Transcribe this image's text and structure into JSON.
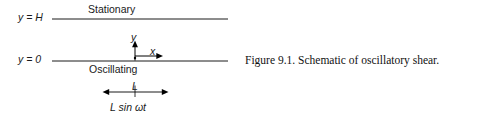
{
  "figure": {
    "caption": "Figure 9.1.  Schematic of oscillatory shear.",
    "diagram": {
      "top_wall_label": "Stationary",
      "bottom_wall_label": "Oscillating",
      "top_boundary_label": "y = H",
      "bottom_boundary_label": "y = 0",
      "axis_y_label": "y",
      "axis_x_label": "x",
      "dimension_label": "L",
      "amplitude_label": "L sin ωt",
      "colors": {
        "line": "#000000",
        "text": "#111111",
        "background": "#ffffff"
      },
      "geometry": {
        "top_line_y": 19,
        "bottom_line_y": 61,
        "line_x_start": 52,
        "line_x_end": 228,
        "origin_x": 135,
        "y_axis_top": 42,
        "x_axis_end": 163,
        "dim_arrow_y": 92,
        "dim_arrow_left": 103,
        "dim_arrow_right": 168,
        "dim_tick_x": 135
      }
    }
  }
}
